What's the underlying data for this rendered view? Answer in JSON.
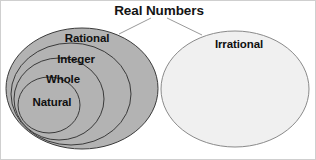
{
  "diagram": {
    "title": "Real Numbers",
    "background_color": "#ffffff",
    "border_color": "#cfcfcf",
    "connector_color": "#9a9a9a",
    "label_color": "#101010",
    "groups": [
      {
        "name": "rational-group",
        "fill_color": "#b3b3b3",
        "stroke_color": "#3a3a3a",
        "sets": [
          {
            "label": "Rational",
            "cx": 81,
            "cy": 87.5,
            "rx": 76,
            "ry": 60.5,
            "label_x": 86,
            "label_y": 41
          },
          {
            "label": "Integer",
            "cx": 70,
            "cy": 93,
            "rx": 60,
            "ry": 51,
            "label_x": 75,
            "label_y": 62
          },
          {
            "label": "Whole",
            "cx": 58,
            "cy": 98,
            "rx": 45,
            "ry": 41,
            "label_x": 62,
            "label_y": 82
          },
          {
            "label": "Natural",
            "cx": 48,
            "cy": 104,
            "rx": 31,
            "ry": 28,
            "label_x": 51,
            "label_y": 105
          }
        ]
      },
      {
        "name": "irrational-group",
        "fill_color": "#f0f0f0",
        "stroke_color": "#8a8a8a",
        "sets": [
          {
            "label": "Irrational",
            "cx": 234,
            "cy": 88,
            "rx": 74,
            "ry": 58,
            "label_x": 238,
            "label_y": 47
          }
        ]
      }
    ],
    "title_position": {
      "x": 158,
      "y": 14
    },
    "connectors": [
      {
        "name": "connector-left",
        "x1": 150,
        "y1": 17,
        "x2": 118,
        "y2": 33
      },
      {
        "name": "connector-right",
        "x1": 166,
        "y1": 17,
        "x2": 201,
        "y2": 34
      }
    ]
  }
}
